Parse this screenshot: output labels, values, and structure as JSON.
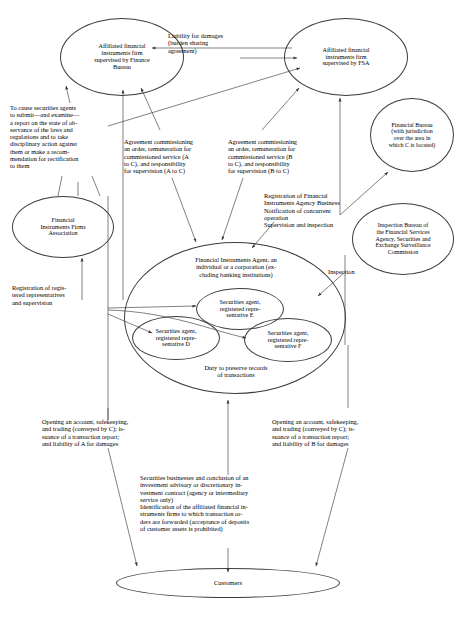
{
  "diagram": {
    "type": "relationship-flow-diagram",
    "colors": {
      "stroke": "#3c3c3c",
      "text": "#000000",
      "background": "#ffffff"
    },
    "nodes": [
      {
        "id": "firm-a",
        "name": "affiliated-firm-finance-bureau",
        "label": "Affiliated financial\ninstruments firm\nsupervised by Finance\nBureau"
      },
      {
        "id": "firm-b",
        "name": "affiliated-firm-fsa",
        "label": "Affiliated financial\ninstruments firm\nsupervised by FSA"
      },
      {
        "id": "financial-bureau",
        "name": "financial-bureau",
        "label": "Financial Bureau\n(with jurisdiction\nover the area in\nwhich C is located)"
      },
      {
        "id": "inspection-bureau",
        "name": "inspection-bureau-fsa-sesc",
        "label": "Inspection Bureau of\nthe Financial Services\nAgency, Securities and\nExchange Surveillance\nCommission"
      },
      {
        "id": "fifa",
        "name": "financial-instruments-firms-association",
        "label": "Financial\nInstruments Firms\nAssociation"
      },
      {
        "id": "agent-c",
        "name": "financial-instruments-agent",
        "label": "Financial Instruments Agent, an\nindividual or a corporation (ex-\ncluding banking institutions)"
      },
      {
        "id": "agent-c-footer",
        "name": "duty-preserve-records",
        "label": "Duty to preserve records\nof transactions"
      },
      {
        "id": "rep-e",
        "name": "securities-agent-rep-e",
        "label": "Securities agent,\nregistered repre-\nsentative E"
      },
      {
        "id": "rep-d",
        "name": "securities-agent-rep-d",
        "label": "Securities agent,\nregistered repre-\nsentative D"
      },
      {
        "id": "rep-f",
        "name": "securities-agent-rep-f",
        "label": "Securities agent,\nregistered repre-\nsentative F"
      },
      {
        "id": "customers",
        "name": "customers",
        "label": "Customers"
      }
    ],
    "edge_labels": [
      {
        "id": "liability-damages",
        "name": "edge-label-liability-for-damages",
        "text": "Liability for damages\n(burden sharing\nagreement)"
      },
      {
        "id": "cause-securities-agents",
        "name": "edge-label-cause-securities-agents-report",
        "text": "To cause securities agents\nto submit—and examine—\na report on the state of ob-\nservance of the laws and\nregulations and to take\ndisciplinary action against\nthem or make a recom-\nmendation for rectification\nto them"
      },
      {
        "id": "agreement-a-to-c",
        "name": "edge-label-agreement-a-to-c",
        "text": "Agreement commissioning\nan order, remuneration for\ncommissioned service (A\nto C), and responsibility\nfor supervision (A to C)"
      },
      {
        "id": "agreement-b-to-c",
        "name": "edge-label-agreement-b-to-c",
        "text": "Agreement commissioning\nan order, remuneration for\ncommissioned service (B\nto C), and responsibility\nfor supervision (B to C)"
      },
      {
        "id": "registration-agency-business",
        "name": "edge-label-registration-agency-business",
        "text": "Registration of Financial\nInstruments Agency Business\nNotification of concurrent\noperation\nSupervision and inspection"
      },
      {
        "id": "inspection",
        "name": "edge-label-inspection",
        "text": "Inspection"
      },
      {
        "id": "registration-reps",
        "name": "edge-label-registration-representatives",
        "text": "Registration of regis-\ntered representatives\nand supervision"
      },
      {
        "id": "opening-account-a",
        "name": "edge-label-opening-account-liability-a",
        "text": "Opening an account, safekeeping,\nand trading (conveyed by C); is-\nsuance of a transaction report;\nand liability of A for damages"
      },
      {
        "id": "opening-account-b",
        "name": "edge-label-opening-account-liability-b",
        "text": "Opening an account, safekeeping,\nand trading (conveyed by C); is-\nsuance of a transaction report;\nand liability of B for damages"
      },
      {
        "id": "securities-businesses",
        "name": "edge-label-securities-businesses-identification",
        "text": "Securities businesses and conclusion of an\ninvestment advisory or discretionary in-\nvestment contract (agency or intermediary\nservice only)\nIdentification of the affiliated financial in-\nstruments firms to which transaction or-\nders are forwarded (acceptance of deposits\nof customer assets is prohibited)"
      }
    ]
  }
}
